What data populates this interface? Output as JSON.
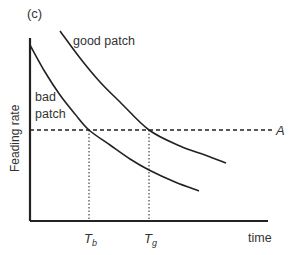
{
  "panel_label": "(c)",
  "chart_data": {
    "type": "line",
    "title": "",
    "xlabel": "time",
    "ylabel": "Feading rate",
    "grid": false,
    "legend": "inline labels",
    "series": [
      {
        "name": "good patch",
        "label_text": "good patch",
        "style": "solid",
        "points": [
          [
            60,
            31
          ],
          [
            80,
            58
          ],
          [
            100,
            82
          ],
          [
            120,
            102
          ],
          [
            149,
            130
          ],
          [
            180,
            146
          ],
          [
            205,
            155
          ],
          [
            226,
            163
          ]
        ]
      },
      {
        "name": "bad patch",
        "label_text_line1": "bad",
        "label_text_line2": "patch",
        "style": "solid",
        "points": [
          [
            30,
            45
          ],
          [
            45,
            72
          ],
          [
            60,
            95
          ],
          [
            75,
            114
          ],
          [
            89,
            130
          ],
          [
            110,
            145
          ],
          [
            130,
            159
          ],
          [
            149,
            170
          ],
          [
            175,
            182
          ],
          [
            199,
            191
          ]
        ]
      }
    ],
    "reference_lines": [
      {
        "name": "A",
        "label": "A",
        "orientation": "horizontal",
        "style": "dashed",
        "y_px": 130
      },
      {
        "name": "T_b",
        "label_main": "T",
        "label_sub": "b",
        "orientation": "vertical",
        "style": "dotted",
        "x_px": 89
      },
      {
        "name": "T_g",
        "label_main": "T",
        "label_sub": "g",
        "orientation": "vertical",
        "style": "dotted",
        "x_px": 149
      }
    ],
    "axes": {
      "origin_px": [
        30,
        221
      ],
      "x_end_px": 268,
      "y_top_px": 38
    },
    "annotation": "Time T_b at which bad patch rate falls to A occurs earlier than T_g for good patch"
  }
}
